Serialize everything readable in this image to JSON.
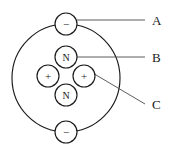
{
  "figure": {
    "background_color": "#ffffff",
    "stroke_color": "#1a1a1a",
    "leader_color": "#4a4a4a"
  },
  "orbit": {
    "name": "electron-orbit",
    "cx": 66,
    "cy": 78,
    "r": 54
  },
  "electrons": [
    {
      "id": "electron-top",
      "glyph": "−",
      "cx": 66,
      "cy": 24,
      "r": 11
    },
    {
      "id": "electron-bottom",
      "glyph": "−",
      "cx": 66,
      "cy": 132,
      "r": 11
    }
  ],
  "nucleus": [
    {
      "id": "neutron-top",
      "glyph": "N",
      "cx": 66,
      "cy": 57,
      "r": 11
    },
    {
      "id": "proton-left",
      "glyph": "+",
      "cx": 48,
      "cy": 76,
      "r": 11
    },
    {
      "id": "proton-right",
      "glyph": "+",
      "cx": 84,
      "cy": 76,
      "r": 11
    },
    {
      "id": "neutron-bottom",
      "glyph": "N",
      "cx": 66,
      "cy": 95,
      "r": 11
    }
  ],
  "labels": [
    {
      "id": "label-a",
      "text": "A",
      "x": 152,
      "y": 20,
      "leader": {
        "x1": 77,
        "y1": 20,
        "x2": 145,
        "y2": 20
      }
    },
    {
      "id": "label-b",
      "text": "B",
      "x": 152,
      "y": 57,
      "leader": {
        "x1": 77,
        "y1": 57,
        "x2": 145,
        "y2": 57
      }
    },
    {
      "id": "label-c",
      "text": "C",
      "x": 152,
      "y": 104,
      "leader": {
        "x1": 91,
        "y1": 72,
        "x2": 145,
        "y2": 104
      }
    }
  ]
}
